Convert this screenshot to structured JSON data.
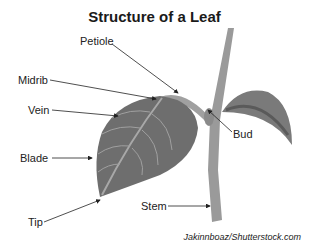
{
  "title": "Structure of a Leaf",
  "labels": {
    "petiole": "Petiole",
    "midrib": "Midrib",
    "vein": "Vein",
    "blade": "Blade",
    "tip": "Tip",
    "bud": "Bud",
    "stem": "Stem"
  },
  "credit": "Jakinnboaz/Shutterstock.com",
  "colors": {
    "leaf": "#6e6e6e",
    "vein": "#a8a8a8",
    "stem": "#9a9a9a",
    "arrow": "#222222"
  }
}
